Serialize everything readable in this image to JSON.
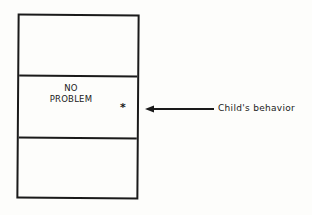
{
  "diagram": {
    "sections": [
      {
        "label": ""
      },
      {
        "label_line1": "NO",
        "label_line2": "PROBLEM"
      },
      {
        "label": ""
      }
    ],
    "marker": "*",
    "arrow_caption": "Child's behavior",
    "colors": {
      "ink": "#1a1a1a",
      "background": "#fdfdfb"
    }
  }
}
